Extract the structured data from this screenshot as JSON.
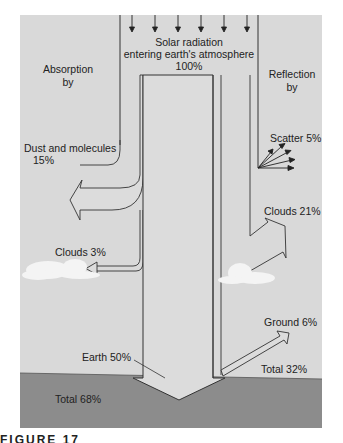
{
  "diagram": {
    "type": "energy-flow",
    "colors": {
      "atmosphere_bg": "#d9d9d9",
      "ground": "#8c8c8c",
      "arrow_fill": "#dcdcdc",
      "line": "#333333",
      "cloud": "#f4f4f4"
    },
    "incoming": {
      "line1": "Solar radiation",
      "line2": "entering earth's atmosphere",
      "line3": "100%"
    },
    "absorption": {
      "header_line1": "Absorption",
      "header_line2": "by",
      "dust": {
        "line1": "Dust and molecules",
        "line2": "15%"
      },
      "clouds": "Clouds 3%",
      "earth": "Earth 50%",
      "total": "Total 68%"
    },
    "reflection": {
      "header_line1": "Reflection",
      "header_line2": "by",
      "scatter": "Scatter 5%",
      "clouds": "Clouds 21%",
      "ground": "Ground 6%",
      "total": "Total 32%"
    }
  },
  "caption": "FIGURE 17"
}
